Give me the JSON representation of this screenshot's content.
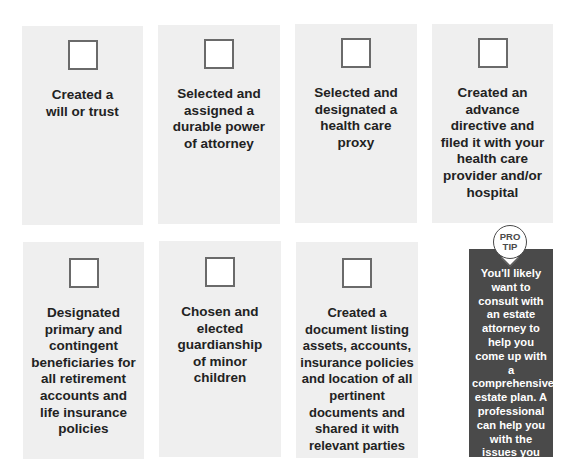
{
  "checklist": [
    {
      "label": "Created a will or trust",
      "checked": false
    },
    {
      "label": "Selected and assigned a durable power of attorney",
      "checked": false
    },
    {
      "label": "Selected and designated a health care proxy",
      "checked": false
    },
    {
      "label": "Created an advance directive and filed it with your health care provider and/or hospital",
      "checked": false
    },
    {
      "label": "Designated primary and contingent beneficiaries for all retirement accounts and life insurance policies",
      "checked": false
    },
    {
      "label": "Chosen and elected guardianship of minor children",
      "checked": false
    },
    {
      "label": "Created a document listing assets, accounts, insurance policies and location of all pertinent documents and shared it with relevant parties",
      "checked": false
    }
  ],
  "pro_tip": {
    "badge_line1": "PRO",
    "badge_line2": "TIP",
    "text": "You'll likely want to consult with an estate attorney to help you come up with a comprehensive estate plan. A professional can help you with the issues you need to address and ensure that your wishes will be enacted."
  },
  "colors": {
    "card_bg": "#efefef",
    "tip_bg": "#4a4a4a",
    "checkbox_border": "#6a6a6a"
  }
}
